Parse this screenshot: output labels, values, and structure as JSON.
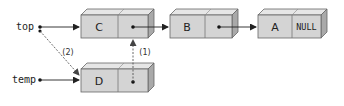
{
  "diagram": {
    "type": "linked-list-insert-at-front",
    "pointers": {
      "top": {
        "label": "top"
      },
      "temp": {
        "label": "temp"
      }
    },
    "nodes": [
      {
        "id": "C",
        "data": "C",
        "next": "B"
      },
      {
        "id": "B",
        "data": "B",
        "next": "A"
      },
      {
        "id": "A",
        "data": "A",
        "next_label": "NULL"
      },
      {
        "id": "D",
        "data": "D",
        "next": "C"
      }
    ],
    "steps": [
      {
        "label": "(1)",
        "description": "D.next -> C"
      },
      {
        "label": "(2)",
        "description": "top -> D"
      }
    ],
    "colors": {
      "box_front": "#d4d4d4",
      "box_top": "#e6e6e6",
      "box_side": "#a9a9a9",
      "stroke": "#555555",
      "arrow": "#222222",
      "dashed_arrow": "#555555"
    }
  }
}
